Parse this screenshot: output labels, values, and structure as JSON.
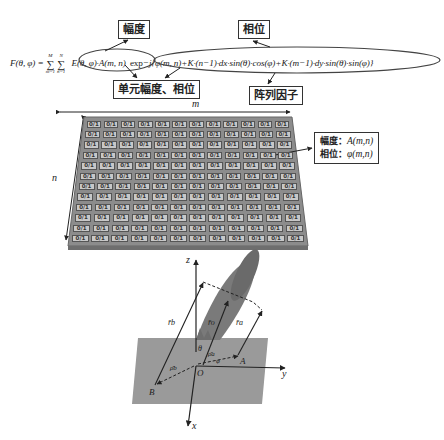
{
  "labels": {
    "amplitude": "幅度",
    "phase": "相位",
    "element_amp_phase": "单元幅度、相位",
    "array_factor": "阵列因子"
  },
  "formula": {
    "lhs": "F(θ, φ) = ",
    "sum_m_top": "M",
    "sum_m_bottom": "m=1",
    "sum_n_top": "N",
    "sum_n_bottom": "n=1",
    "element_term": "E(θ, φ)·A(m, n)",
    "exp": "exp",
    "phase_term": "−j{φ(m, n)+K·(n−1)·dx·sin(θ)·cos(φ)+K·(m−1)·dy·sin(θ)·sin(φ)}"
  },
  "grid": {
    "axis_m": "m",
    "axis_n": "n",
    "rows": 12,
    "cols": 12,
    "cell_text": "0/1"
  },
  "callout": {
    "amp_label": "幅度：",
    "amp_value": "A(m,n)",
    "phase_label": "相位：",
    "phase_value": "φ(m,n)"
  },
  "coord": {
    "z": "z",
    "y": "y",
    "x": "x",
    "origin": "O",
    "point_a": "A",
    "point_b": "B",
    "theta": "θ",
    "phi": "φ",
    "r_b": "r̄b",
    "r_o": "r̄o",
    "r_a": "r̄a",
    "rho_a": "ρ̄a",
    "rho_b": "ρ̄b"
  },
  "colors": {
    "plate": "#9a9a9a",
    "grid_bg": "#8c8c8c",
    "cell": "#c8c8c8",
    "beam": "#7a7a7a"
  }
}
